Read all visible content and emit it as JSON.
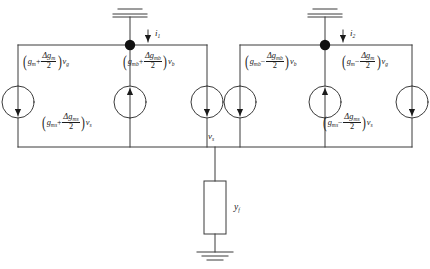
{
  "diagram": {
    "type": "circuit-schematic"
  },
  "sources": [
    {
      "id": "src-gm-plus-vg",
      "position": "left-outer",
      "arrow": "down",
      "label": {
        "lead": "g",
        "lead_sub": "m",
        "op": "+",
        "num_delta": "Δg",
        "num_sub": "m",
        "den": "2",
        "mult": "v",
        "mult_sub": "g"
      },
      "label_text": "(g_m + Δg_m/2)v_g"
    },
    {
      "id": "src-gms-plus-vs",
      "position": "left-inner",
      "arrow": "up",
      "label": {
        "lead": "g",
        "lead_sub": "ms",
        "op": "+",
        "num_delta": "Δg",
        "num_sub": "ms",
        "den": "2",
        "mult": "v",
        "mult_sub": "s"
      },
      "label_text": "(g_ms + Δg_ms/2)v_s"
    },
    {
      "id": "src-gmb-plus-vb",
      "position": "left-right",
      "arrow": "down",
      "label": {
        "lead": "g",
        "lead_sub": "mb",
        "op": "+",
        "num_delta": "Δg",
        "num_sub": "mb",
        "den": "2",
        "mult": "v",
        "mult_sub": "b"
      },
      "label_text": "(g_mb + Δg_mb/2)v_b"
    },
    {
      "id": "src-gmb-minus-vb",
      "position": "right-outer-left",
      "arrow": "down",
      "label": {
        "lead": "g",
        "lead_sub": "mb",
        "op": "−",
        "num_delta": "Δg",
        "num_sub": "mb",
        "den": "2",
        "mult": "v",
        "mult_sub": "b"
      },
      "label_text": "(g_mb − Δg_mb/2)v_b"
    },
    {
      "id": "src-gms-minus-vs",
      "position": "right-inner",
      "arrow": "up",
      "label": {
        "lead": "g",
        "lead_sub": "ms",
        "op": "−",
        "num_delta": "Δg",
        "num_sub": "ms",
        "den": "2",
        "mult": "v",
        "mult_sub": "s"
      },
      "label_text": "(g_ms − Δg_ms/2)v_s"
    },
    {
      "id": "src-gm-minus-vg",
      "position": "right-outer",
      "arrow": "down",
      "label": {
        "lead": "g",
        "lead_sub": "m",
        "op": "−",
        "num_delta": "Δg",
        "num_sub": "m",
        "den": "2",
        "mult": "v",
        "mult_sub": "g"
      },
      "label_text": "(g_m − Δg_m/2)v_g"
    }
  ],
  "currents": [
    {
      "id": "i1",
      "symbol": "i",
      "subscript": "1",
      "direction": "down"
    },
    {
      "id": "i2",
      "symbol": "i",
      "subscript": "2",
      "direction": "down"
    }
  ],
  "nodes": [
    {
      "id": "vs",
      "symbol": "v",
      "subscript": "s"
    }
  ],
  "impedance": {
    "id": "yf",
    "symbol": "y",
    "subscript": "f"
  },
  "grounds": [
    {
      "id": "ground-top-left"
    },
    {
      "id": "ground-top-right"
    },
    {
      "id": "ground-bottom"
    }
  ],
  "colors": {
    "wire": "#3a3a3a",
    "text": "#1b1b1b",
    "node_dot": "#111111",
    "background": "#ffffff"
  }
}
